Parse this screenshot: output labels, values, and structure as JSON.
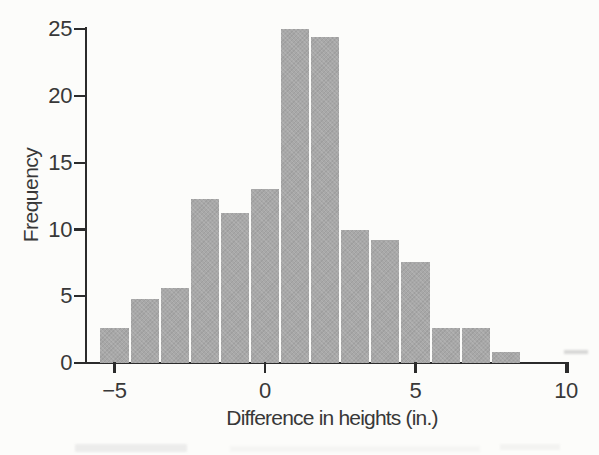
{
  "figure": {
    "background_color": "#fcfcfa",
    "bar_color": "#a8a8a8",
    "axis_color": "#2b2b2b",
    "text_color": "#383838"
  },
  "chart_data": {
    "type": "bar",
    "subtype": "histogram",
    "title": "",
    "xlabel": "Difference in heights (in.)",
    "ylabel": "Frequency",
    "bin_width": 1,
    "bin_centers": [
      -5,
      -4,
      -3,
      -2,
      -1,
      0,
      1,
      2,
      3,
      4,
      5,
      6,
      7,
      8
    ],
    "values": [
      2.6,
      4.8,
      5.6,
      12.3,
      11.2,
      13.0,
      25.0,
      24.4,
      10.0,
      9.2,
      7.6,
      2.6,
      2.6,
      0.8
    ],
    "xlim": [
      -6,
      10
    ],
    "ylim": [
      0,
      25
    ],
    "grid": false,
    "legend": null,
    "x_ticks": [
      {
        "value": -5,
        "label": "−5"
      },
      {
        "value": 0,
        "label": "0"
      },
      {
        "value": 5,
        "label": "5"
      },
      {
        "value": 10,
        "label": "10"
      }
    ],
    "y_ticks": [
      {
        "value": 0,
        "label": "0"
      },
      {
        "value": 5,
        "label": "5"
      },
      {
        "value": 10,
        "label": "10"
      },
      {
        "value": 15,
        "label": "15"
      },
      {
        "value": 20,
        "label": "20"
      },
      {
        "value": 25,
        "label": "25"
      }
    ]
  }
}
